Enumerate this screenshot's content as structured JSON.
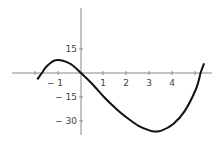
{
  "chart_data": {
    "type": "line",
    "title": "",
    "xlabel": "",
    "ylabel": "",
    "grid": false,
    "xlim": [
      -2.0,
      5.4
    ],
    "ylim": [
      -40,
      40
    ],
    "x_ticks": [
      -2,
      -1,
      1,
      2,
      3,
      4,
      5
    ],
    "x_tick_labels": [
      "",
      "-1",
      "1",
      "2",
      "3",
      "4",
      ""
    ],
    "y_ticks": [
      15,
      -15,
      -30
    ],
    "y_tick_labels": [
      "15",
      "-15",
      "-30"
    ],
    "series": [
      {
        "name": "f(x)",
        "x": [
          -1.9,
          -1.7,
          -1.5,
          -1.1,
          -0.5,
          0,
          0.5,
          1,
          1.5,
          2,
          2.5,
          3,
          3.2,
          3.5,
          4,
          4.5,
          5,
          5.2,
          5.35
        ],
        "y": [
          -4,
          0,
          4,
          8,
          6,
          0,
          -7,
          -15,
          -22,
          -28,
          -33,
          -36,
          -36.5,
          -36,
          -32,
          -24,
          -10,
          0,
          6
        ]
      }
    ]
  },
  "labels": {
    "y15": "15",
    "ym15": "− 15",
    "ym30": "− 30",
    "xm1": "− 1",
    "x1": "1",
    "x2": "2",
    "x3": "3",
    "x4": "4"
  }
}
